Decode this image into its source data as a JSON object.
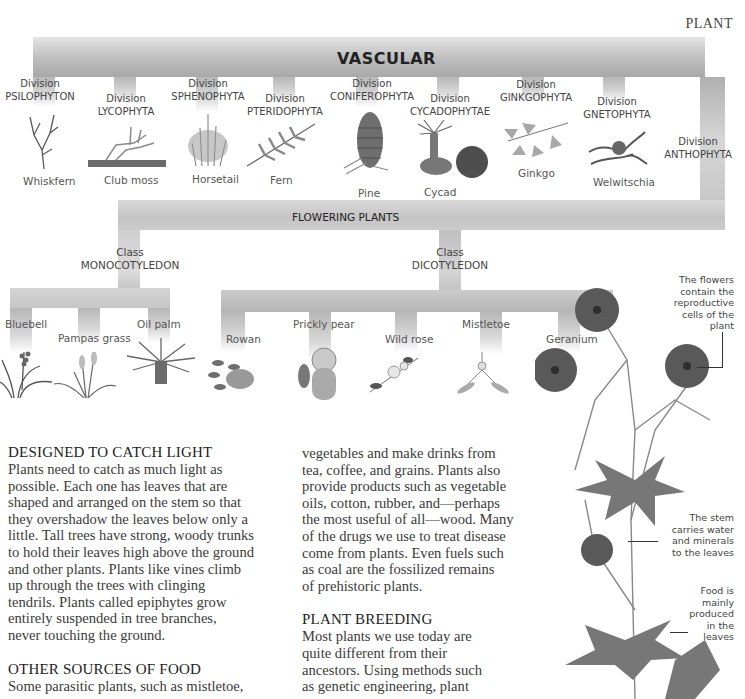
{
  "running_head": "PLANT",
  "tree": {
    "root_label": "VASCULAR",
    "divisions": [
      {
        "prefix": "Division",
        "name": "PSILOPHYTON",
        "plant": "Whiskfern"
      },
      {
        "prefix": "Division",
        "name": "LYCOPHYTA",
        "plant": "Club moss"
      },
      {
        "prefix": "Division",
        "name": "SPHENOPHYTA",
        "plant": "Horsetail"
      },
      {
        "prefix": "Division",
        "name": "PTERIDOPHYTA",
        "plant": "Fern"
      },
      {
        "prefix": "Division",
        "name": "CONIFEROPHYTA",
        "plant": "Pine"
      },
      {
        "prefix": "Division",
        "name": "CYCADOPHYTAE",
        "plant": "Cycad"
      },
      {
        "prefix": "Division",
        "name": "GINKGOPHYTA",
        "plant": "Ginkgo"
      },
      {
        "prefix": "Division",
        "name": "GNETOPHYTA",
        "plant": "Welwitschia"
      },
      {
        "prefix": "Division",
        "name": "ANTHOPHYTA",
        "plant": ""
      }
    ],
    "flowering_label": "FLOWERING PLANTS",
    "classes": [
      {
        "prefix": "Class",
        "name": "MONOCOTYLEDON",
        "plants": [
          "Bluebell",
          "Pampas grass",
          "Oil palm"
        ]
      },
      {
        "prefix": "Class",
        "name": "DICOTYLEDON",
        "plants": [
          "Rowan",
          "Prickly pear",
          "Wild rose",
          "Mistletoe",
          "Geranium"
        ]
      }
    ]
  },
  "annotations": {
    "flowers": [
      "The flowers",
      "contain the",
      "reproductive",
      "cells of the",
      "plant"
    ],
    "stem": [
      "The stem",
      "carries water",
      "and minerals",
      "to the leaves"
    ],
    "leaves": [
      "Food is",
      "mainly",
      "produced",
      "in the",
      "leaves"
    ]
  },
  "article": {
    "sections": [
      {
        "heading": "DESIGNED TO CATCH LIGHT",
        "lines": [
          "Plants need to catch as much light as",
          "possible. Each one has leaves that are",
          "shaped and arranged on the stem so that",
          "they overshadow the leaves below only a",
          "little. Tall trees have strong, woody trunks",
          "to hold their leaves high above the ground",
          "and other plants. Plants like vines climb",
          "up through the trees with clinging",
          "tendrils. Plants called epiphytes grow",
          "entirely suspended in tree branches,",
          "never touching the ground."
        ]
      },
      {
        "heading": "OTHER SOURCES OF FOOD",
        "lines": [
          "Some parasitic plants, such as mistletoe,"
        ]
      }
    ],
    "column2": {
      "lines": [
        "vegetables and make drinks from",
        "tea, coffee, and grains. Plants also",
        "provide products such as vegetable",
        "oils, cotton, rubber, and—perhaps",
        "the most useful of all—wood. Many",
        "of the drugs we use to treat disease",
        "come from plants. Even fuels such",
        "as coal are the fossilized remains",
        "of prehistoric plants."
      ],
      "heading": "PLANT BREEDING",
      "lines2": [
        "Most plants we use today are",
        "quite different from their",
        "ancestors. Using methods such",
        "as genetic engineering, plant"
      ]
    }
  }
}
